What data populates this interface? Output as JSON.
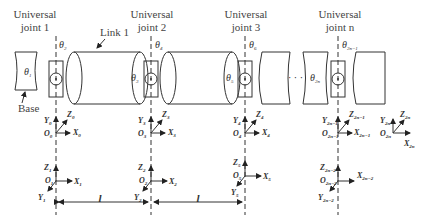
{
  "title_labels": {
    "joint1": [
      "Universal",
      "joint 1"
    ],
    "joint2": [
      "Universal",
      "joint 2"
    ],
    "joint3": [
      "Universal",
      "joint 3"
    ],
    "jointn": [
      "Universal",
      "joint n"
    ],
    "link1": "Link 1",
    "base": "Base"
  },
  "angles": {
    "t1": {
      "sym": "θ",
      "sub": "1"
    },
    "t2": {
      "sym": "θ",
      "sub": "2"
    },
    "t3": {
      "sym": "θ",
      "sub": "3"
    },
    "t4": {
      "sym": "θ",
      "sub": "4"
    },
    "t5": {
      "sym": "θ",
      "sub": "5"
    },
    "t6": {
      "sym": "θ",
      "sub": "6"
    },
    "t2n": {
      "sym": "θ",
      "sub": "2n"
    },
    "t2n1": {
      "sym": "θ",
      "sub": "2n−1"
    }
  },
  "frames": {
    "f0": {
      "O": "O",
      "X": "X",
      "Y": "Y",
      "Z": "Z",
      "sub": "0"
    },
    "f1": {
      "O": "O",
      "X": "X",
      "Y": "Y",
      "Z": "Z",
      "sub": "1"
    },
    "f2": {
      "O": "O",
      "X": "X",
      "Y": "Y",
      "Z": "Z",
      "sub": "2"
    },
    "f3": {
      "O": "O",
      "X": "X",
      "Y": "Y",
      "Z": "Z",
      "sub": "3"
    },
    "f4": {
      "O": "O",
      "X": "X",
      "Y": "Y",
      "Z": "Z",
      "sub": "4"
    },
    "f5": {
      "O": "O",
      "X": "X",
      "Y": "Y",
      "Z": "Z",
      "sub": "5"
    },
    "f2n2": {
      "O": "O",
      "X": "X",
      "Y": "Y",
      "Z": "Z",
      "sub": "2n−2"
    },
    "f2n1": {
      "O": "O",
      "X": "X",
      "Y": "Y",
      "Z": "Z",
      "sub": "2n−1"
    },
    "f2n": {
      "O": "O",
      "X": "X",
      "Y": "Y",
      "Z": "Z",
      "sub": "2n"
    }
  },
  "dimensions": {
    "d1": "l",
    "d2": "l"
  },
  "ellipsis": "· · ·"
}
